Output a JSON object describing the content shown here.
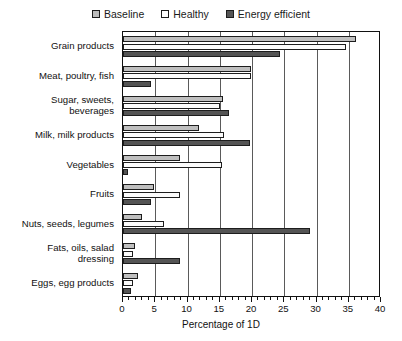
{
  "chart_data": {
    "type": "bar",
    "orientation": "horizontal",
    "title": "",
    "xlabel": "Percentage of 1D",
    "ylabel": "",
    "xlim": [
      0,
      40
    ],
    "xticks": [
      0,
      5,
      10,
      15,
      20,
      25,
      30,
      35,
      40
    ],
    "xtick_labels": [
      "0",
      "5",
      "10",
      "15",
      "20",
      "25",
      "30",
      "35",
      "40"
    ],
    "minor_tick_step": 1,
    "grid": "vertical",
    "legend_position": "top-center",
    "categories": [
      "Grain products",
      "Meat, poultry, fish",
      "Sugar, sweets,\nbeverages",
      "Milk, milk products",
      "Vegetables",
      "Fruits",
      "Nuts, seeds, legumes",
      "Fats, oils, salad\ndressing",
      "Eggs, egg products"
    ],
    "series": [
      {
        "name": "Baseline",
        "color": "#bfbfbf",
        "values": [
          36.1,
          19.8,
          15.5,
          11.8,
          8.8,
          4.8,
          3.0,
          1.9,
          2.3
        ]
      },
      {
        "name": "Healthy",
        "color": "#ffffff",
        "values": [
          34.6,
          19.8,
          15.0,
          15.6,
          15.3,
          8.9,
          6.4,
          1.5,
          1.6
        ]
      },
      {
        "name": "Energy efficient",
        "color": "#545454",
        "values": [
          24.3,
          4.4,
          16.4,
          19.7,
          0.8,
          4.4,
          29.0,
          8.9,
          1.3
        ]
      }
    ]
  },
  "legend": {
    "items": [
      {
        "label": "Baseline",
        "swatch": "legend-swatch-baseline"
      },
      {
        "label": "Healthy",
        "swatch": "legend-swatch-healthy"
      },
      {
        "label": "Energy efficient",
        "swatch": "legend-swatch-energy-efficient"
      }
    ]
  },
  "axis": {
    "x_title": "Percentage of 1D"
  }
}
